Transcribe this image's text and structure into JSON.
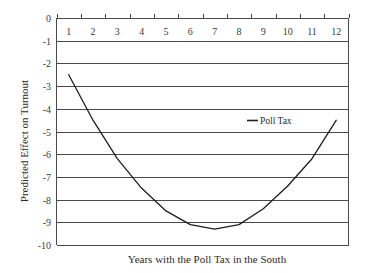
{
  "chart_data": {
    "type": "line",
    "title": "",
    "xlabel": "Years with the Poll Tax in the South",
    "ylabel": "Predicted Effect on Turnout",
    "categories": [
      "1",
      "2",
      "3",
      "4",
      "5",
      "6",
      "7",
      "8",
      "9",
      "10",
      "11",
      "12"
    ],
    "series": [
      {
        "name": "Poll Tax",
        "values": [
          -2.5,
          -4.5,
          -6.2,
          -7.5,
          -8.5,
          -9.1,
          -9.3,
          -9.1,
          -8.4,
          -7.4,
          -6.2,
          -4.5
        ],
        "color": "#1e1e1e"
      }
    ],
    "ylim": [
      -10,
      0
    ],
    "yticks": [
      "0",
      "-1",
      "-2",
      "-3",
      "-4",
      "-5",
      "-6",
      "-7",
      "-8",
      "-9",
      "-10"
    ],
    "grid": true,
    "x_axis_position": "top",
    "legend_position": "inside-right"
  }
}
